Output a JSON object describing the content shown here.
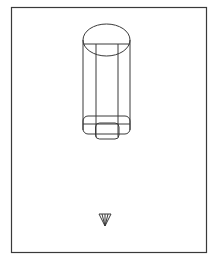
{
  "diagram": {
    "type": "technical line drawing",
    "stroke_color": "#3a3a3a",
    "background": "#ffffff",
    "frame": {
      "x": 11,
      "y": 7,
      "width": 195,
      "height": 245
    },
    "marker": {
      "symbol": "inverted-triangle-section-mark",
      "x": 105,
      "y": 219
    }
  }
}
